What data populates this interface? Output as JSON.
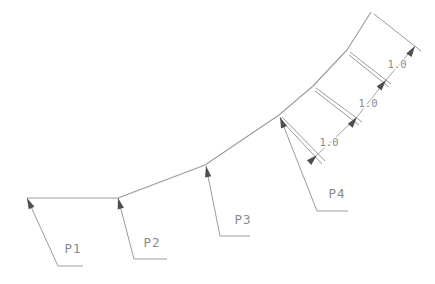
{
  "diagram": {
    "type": "cad-polyline-with-measure-dimensions",
    "background_color": "#ffffff",
    "line_color": "#9b9b9b",
    "arrow_color": "#4f4f4f",
    "text_color": "#8a8a8a",
    "curve_points": [
      [
        27,
        198
      ],
      [
        118,
        198
      ],
      [
        205,
        165
      ],
      [
        279,
        115
      ],
      [
        313,
        86
      ],
      [
        347,
        50
      ],
      [
        371,
        12
      ]
    ],
    "point_labels": [
      {
        "label": "P1",
        "tip": [
          27,
          198
        ],
        "elbow": [
          58,
          266
        ],
        "h_end": [
          83,
          266
        ],
        "text_pos": [
          73,
          253
        ]
      },
      {
        "label": "P2",
        "tip": [
          118,
          198
        ],
        "elbow": [
          134,
          259
        ],
        "h_end": [
          167,
          259
        ],
        "text_pos": [
          152,
          247
        ]
      },
      {
        "label": "P3",
        "tip": [
          206,
          166
        ],
        "elbow": [
          220,
          236
        ],
        "h_end": [
          250,
          236
        ],
        "text_pos": [
          243,
          224
        ]
      },
      {
        "label": "P4",
        "tip": [
          280,
          117
        ],
        "elbow": [
          317,
          211
        ],
        "h_end": [
          348,
          211
        ],
        "text_pos": [
          337,
          198
        ]
      }
    ],
    "extension_lines": [
      [
        [
          374,
          14
        ],
        [
          421,
          51
        ]
      ],
      [
        [
          350,
          52
        ],
        [
          391,
          84
        ]
      ],
      [
        [
          349,
          55
        ],
        [
          389,
          87
        ]
      ],
      [
        [
          316,
          88
        ],
        [
          362,
          122
        ]
      ],
      [
        [
          315,
          91
        ],
        [
          359,
          125
        ]
      ],
      [
        [
          282,
          117
        ],
        [
          325,
          161
        ]
      ],
      [
        [
          281,
          120
        ],
        [
          322,
          164
        ]
      ]
    ],
    "dimensions": [
      {
        "value": "1.0",
        "from": [
          386,
          80
        ],
        "to": [
          415,
          46
        ],
        "text_pos": [
          397,
          68
        ]
      },
      {
        "value": "1.0",
        "from": [
          357,
          117
        ],
        "to": [
          386,
          80
        ],
        "text_pos": [
          368,
          107
        ]
      },
      {
        "value": "1.0",
        "from": [
          317,
          155
        ],
        "to": [
          357,
          117
        ],
        "text_pos": [
          329,
          146
        ]
      }
    ],
    "tick_arrows": [
      {
        "at": [
          415,
          46
        ],
        "dir": [
          0.55,
          -0.84
        ]
      },
      {
        "at": [
          386,
          80
        ],
        "dir": [
          0.63,
          -0.78
        ]
      },
      {
        "at": [
          357,
          117
        ],
        "dir": [
          0.62,
          -0.79
        ]
      },
      {
        "at": [
          317,
          155
        ],
        "dir": [
          0.72,
          -0.7
        ]
      }
    ]
  }
}
